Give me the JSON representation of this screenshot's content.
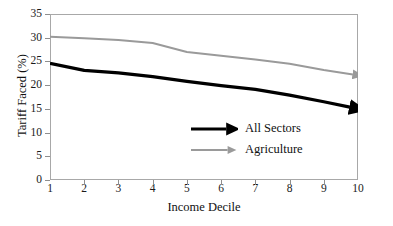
{
  "chart_data": {
    "type": "line",
    "title": "",
    "xlabel": "Income Decile",
    "ylabel": "Tariff Faced (%)",
    "x": [
      1,
      2,
      3,
      4,
      5,
      6,
      7,
      8,
      9,
      10
    ],
    "xticklabels": [
      "1",
      "2",
      "3",
      "4",
      "5",
      "6",
      "7",
      "8",
      "9",
      "10"
    ],
    "yticklabels": [
      "0",
      "5",
      "10",
      "15",
      "20",
      "25",
      "30",
      "35"
    ],
    "yticks": [
      0,
      5,
      10,
      15,
      20,
      25,
      30,
      35
    ],
    "xlim": [
      1,
      10
    ],
    "ylim": [
      0,
      35
    ],
    "grid": false,
    "legend_position": "center",
    "series": [
      {
        "name": "All Sectors",
        "color": "#000000",
        "linewidth": 3.2,
        "arrow_end": true,
        "values": [
          24.6,
          23.1,
          22.6,
          21.8,
          20.8,
          19.9,
          19.1,
          17.9,
          16.5,
          15.0
        ]
      },
      {
        "name": "Agriculture",
        "color": "#9a9a9a",
        "linewidth": 2.0,
        "arrow_end": true,
        "values": [
          30.2,
          29.9,
          29.5,
          28.9,
          27.0,
          26.2,
          25.4,
          24.5,
          23.2,
          22.1
        ]
      }
    ]
  },
  "legend": {
    "items": [
      {
        "label": "All Sectors",
        "color": "#000000"
      },
      {
        "label": "Agriculture",
        "color": "#9a9a9a"
      }
    ]
  },
  "colors": {
    "all_sectors": "#000000",
    "agriculture": "#9a9a9a",
    "frame": "#a8a8a8",
    "text": "#111111",
    "background": "#ffffff"
  }
}
